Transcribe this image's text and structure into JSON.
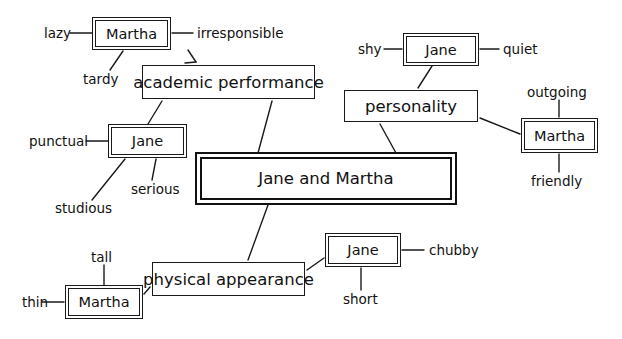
{
  "diagram": {
    "title": "Jane and Martha",
    "type": "concept-map",
    "colors": {
      "line": "#1a1a1a",
      "background": "#ffffff",
      "text": "#111111"
    },
    "central_node": {
      "label": "Jane and Martha",
      "style": "double-heavy"
    },
    "category_nodes": [
      {
        "id": "academic",
        "label": "academic performance",
        "style": "single"
      },
      {
        "id": "personality",
        "label": "personality",
        "style": "single"
      },
      {
        "id": "physical",
        "label": "physical appearance",
        "style": "single"
      }
    ],
    "person_nodes": [
      {
        "id": "martha-academic",
        "label": "Martha",
        "style": "double"
      },
      {
        "id": "jane-academic",
        "label": "Jane",
        "style": "double"
      },
      {
        "id": "jane-personality",
        "label": "Jane",
        "style": "double"
      },
      {
        "id": "martha-personality",
        "label": "Martha",
        "style": "double"
      },
      {
        "id": "martha-physical",
        "label": "Martha",
        "style": "double"
      },
      {
        "id": "jane-physical",
        "label": "Jane",
        "style": "double"
      }
    ],
    "trait_labels": [
      {
        "id": "lazy",
        "label": "lazy"
      },
      {
        "id": "irresponsible",
        "label": "irresponsible"
      },
      {
        "id": "tardy",
        "label": "tardy"
      },
      {
        "id": "punctual",
        "label": "punctual"
      },
      {
        "id": "studious",
        "label": "studious"
      },
      {
        "id": "serious",
        "label": "serious"
      },
      {
        "id": "shy",
        "label": "shy"
      },
      {
        "id": "quiet",
        "label": "quiet"
      },
      {
        "id": "outgoing",
        "label": "outgoing"
      },
      {
        "id": "friendly",
        "label": "friendly"
      },
      {
        "id": "tall",
        "label": "tall"
      },
      {
        "id": "thin",
        "label": "thin"
      },
      {
        "id": "chubby",
        "label": "chubby"
      },
      {
        "id": "short",
        "label": "short"
      }
    ]
  }
}
